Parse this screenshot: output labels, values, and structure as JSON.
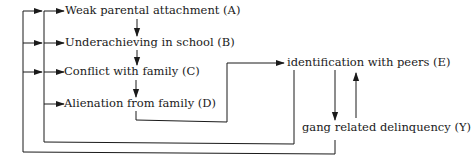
{
  "diagram": {
    "type": "path-diagram",
    "nodes": {
      "A": {
        "label": "Weak parental attachment (A)"
      },
      "B": {
        "label": "Underachieving in school (B)"
      },
      "C": {
        "label": "Conflict with family (C)"
      },
      "D": {
        "label": "Alienation from family (D)"
      },
      "E": {
        "label": "identification with peers (E)"
      },
      "Y": {
        "label": "gang related delinquency (Y)"
      }
    },
    "edges": [
      {
        "from": "A",
        "to": "B"
      },
      {
        "from": "B",
        "to": "C"
      },
      {
        "from": "C",
        "to": "D"
      },
      {
        "from": "D",
        "to": "E"
      },
      {
        "from": "E",
        "to": "Y"
      },
      {
        "from": "Y",
        "to": "E"
      },
      {
        "from": "E",
        "to": [
          "A",
          "B",
          "C",
          "D"
        ]
      },
      {
        "from": "Y",
        "to": [
          "A",
          "B",
          "C"
        ]
      }
    ],
    "line_color": "#1a1a1a"
  }
}
